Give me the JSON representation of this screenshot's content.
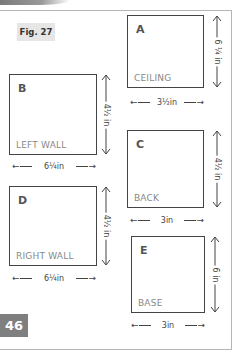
{
  "figure": {
    "label": "Fig. 27"
  },
  "panels": [
    {
      "id": "A",
      "letter": "A",
      "name": "CEILING",
      "width_label": "3½in",
      "height_label": "6 ¼ in"
    },
    {
      "id": "B",
      "letter": "B",
      "name": "LEFT WALL",
      "width_label": "6¼in",
      "height_label": "4½ in"
    },
    {
      "id": "C",
      "letter": "C",
      "name": "BACK",
      "width_label": "3in",
      "height_label": "4½ in"
    },
    {
      "id": "D",
      "letter": "D",
      "name": "RIGHT WALL",
      "width_label": "6¼in",
      "height_label": "4½ in"
    },
    {
      "id": "E",
      "letter": "E",
      "name": "BASE",
      "width_label": "3in",
      "height_label": "6 in"
    }
  ],
  "page_number": "46",
  "colors": {
    "page_number_bg": "#7f7f7f",
    "fig_label_bg": "#e6e6e6",
    "panel_border": "#444444",
    "panel_name_text": "#888888"
  }
}
